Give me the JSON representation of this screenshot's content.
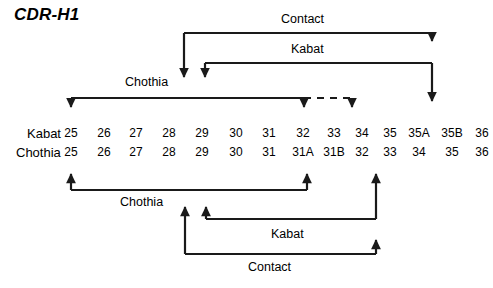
{
  "title": "CDR-H1",
  "numbering_rows": [
    {
      "name": "Kabat",
      "name_x": 27,
      "y": 126,
      "cells": [
        {
          "label": "25",
          "x": 71
        },
        {
          "label": "26",
          "x": 104
        },
        {
          "label": "27",
          "x": 136
        },
        {
          "label": "28",
          "x": 169
        },
        {
          "label": "29",
          "x": 202
        },
        {
          "label": "30",
          "x": 236
        },
        {
          "label": "31",
          "x": 269
        },
        {
          "label": "32",
          "x": 303
        },
        {
          "label": "33",
          "x": 334
        },
        {
          "label": "34",
          "x": 362
        },
        {
          "label": "35",
          "x": 390
        },
        {
          "label": "35A",
          "x": 419
        },
        {
          "label": "35B",
          "x": 452
        },
        {
          "label": "36",
          "x": 482
        }
      ]
    },
    {
      "name": "Chothia",
      "name_x": 16,
      "y": 145,
      "cells": [
        {
          "label": "25",
          "x": 71
        },
        {
          "label": "26",
          "x": 104
        },
        {
          "label": "27",
          "x": 136
        },
        {
          "label": "28",
          "x": 169
        },
        {
          "label": "29",
          "x": 202
        },
        {
          "label": "30",
          "x": 236
        },
        {
          "label": "31",
          "x": 269
        },
        {
          "label": "31A",
          "x": 303
        },
        {
          "label": "31B",
          "x": 334
        },
        {
          "label": "32",
          "x": 362
        },
        {
          "label": "33",
          "x": 390
        },
        {
          "label": "34",
          "x": 419
        },
        {
          "label": "35",
          "x": 452
        },
        {
          "label": "36",
          "x": 482
        }
      ]
    }
  ],
  "bracket_labels": {
    "top_contact": {
      "text": "Contact",
      "x": 281,
      "y": 13
    },
    "top_kabat": {
      "text": "Kabat",
      "x": 291,
      "y": 43
    },
    "top_chothia": {
      "text": "Chothia",
      "x": 125,
      "y": 76
    },
    "bottom_chothia": {
      "text": "Chothia",
      "x": 120,
      "y": 196
    },
    "bottom_kabat": {
      "text": "Kabat",
      "x": 271,
      "y": 228
    },
    "bottom_contact": {
      "text": "Contact",
      "x": 248,
      "y": 261
    }
  },
  "geometry": {
    "stroke": "#1a1a1a",
    "stroke_width": 2.2,
    "dash_pattern": "7 6",
    "top_contact": {
      "left_x": 184,
      "right_x": 432,
      "bar_y": 33,
      "left_end_y": 88,
      "right_end_y": 52
    },
    "top_kabat": {
      "left_x": 205,
      "right_x": 432,
      "bar_y": 63,
      "left_end_y": 88,
      "right_end_y": 112
    },
    "top_chothia": {
      "left_x": 71,
      "right_x": 304,
      "bar_y": 98,
      "end_y": 118,
      "dash_from_x": 304,
      "dash_to_x": 352,
      "dash_arrow_x": 352,
      "dash_arrow_end_y": 118
    },
    "bottom_chothia": {
      "left_x": 71,
      "right_x": 307,
      "bar_y": 190,
      "start_y": 163
    },
    "bottom_kabat": {
      "left_x": 206,
      "right_x": 376,
      "bar_y": 219,
      "left_end_y": 196,
      "right_end_y": 163
    },
    "bottom_contact": {
      "left_x": 185,
      "right_x": 376,
      "bar_y": 254,
      "left_end_y": 196,
      "right_end_y": 229
    }
  }
}
